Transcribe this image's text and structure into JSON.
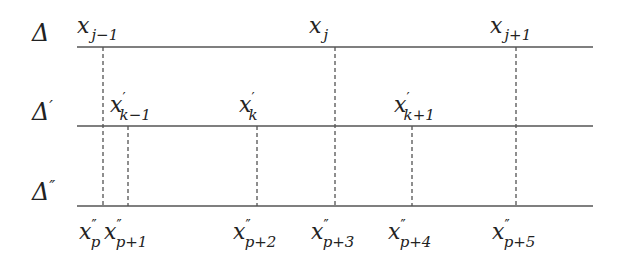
{
  "diagram": {
    "type": "partition refinement diagram",
    "rows": [
      {
        "id": "delta",
        "label": "Δ",
        "prime": "",
        "y": 47,
        "label_position": "above",
        "points": [
          {
            "name": "x_{j-1}",
            "base": "x",
            "prime": "",
            "sub": "j−1",
            "x": 103
          },
          {
            "name": "x_j",
            "base": "x",
            "prime": "",
            "sub": "j",
            "x": 335
          },
          {
            "name": "x_{j+1}",
            "base": "x",
            "prime": "",
            "sub": "j+1",
            "x": 516
          }
        ]
      },
      {
        "id": "delta-prime",
        "label": "Δ",
        "prime": "′",
        "y": 126,
        "label_position": "above",
        "points": [
          {
            "name": "x'_{k-1}",
            "base": "x",
            "prime": "′",
            "sub": "k−1",
            "x": 128
          },
          {
            "name": "x'_k",
            "base": "x",
            "prime": "′",
            "sub": "k",
            "x": 257
          },
          {
            "name": "x'_{k+1}",
            "base": "x",
            "prime": "′",
            "sub": "k+1",
            "x": 412
          }
        ]
      },
      {
        "id": "delta-double-prime",
        "label": "Δ",
        "prime": "″",
        "y": 206,
        "label_position": "below",
        "points": [
          {
            "name": "x''_p",
            "base": "x",
            "prime": "″",
            "sub": "p",
            "x": 103
          },
          {
            "name": "x''_{p+1}",
            "base": "x",
            "prime": "″",
            "sub": "p+1",
            "x": 128
          },
          {
            "name": "x''_{p+2}",
            "base": "x",
            "prime": "″",
            "sub": "p+2",
            "x": 257
          },
          {
            "name": "x''_{p+3}",
            "base": "x",
            "prime": "″",
            "sub": "p+3",
            "x": 335
          },
          {
            "name": "x''_{p+4}",
            "base": "x",
            "prime": "″",
            "sub": "p+4",
            "x": 412
          },
          {
            "name": "x''_{p+5}",
            "base": "x",
            "prime": "″",
            "sub": "p+5",
            "x": 516
          }
        ]
      }
    ],
    "dashed_verticals": [
      {
        "x": 103,
        "from_y": 47,
        "to_y": 206
      },
      {
        "x": 128,
        "from_y": 126,
        "to_y": 206
      },
      {
        "x": 257,
        "from_y": 126,
        "to_y": 206
      },
      {
        "x": 335,
        "from_y": 47,
        "to_y": 206
      },
      {
        "x": 412,
        "from_y": 126,
        "to_y": 206
      },
      {
        "x": 516,
        "from_y": 47,
        "to_y": 206
      }
    ],
    "line_x_start": 77,
    "line_x_end": 593,
    "colors": {
      "line": "#555555",
      "text": "#222222",
      "dash": "#444444"
    }
  }
}
